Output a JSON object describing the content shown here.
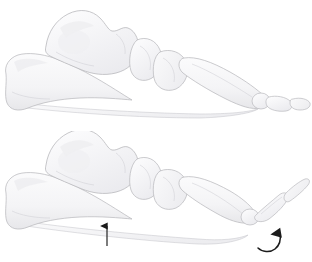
{
  "illustration": {
    "title": "Foot skeleton lateral view - windlass mechanism",
    "background_color": "#ffffff",
    "bone_fill_color": "#f7f7f8",
    "bone_outline_color": "#b9b9bd",
    "bone_shadow_color": "#e9e9ec",
    "arrow_color": "#1b1b1b",
    "panel_count": 2,
    "panels": [
      {
        "id": "panel-top",
        "label": "Neutral foot, resting position",
        "has_arrows": false,
        "toe_position": "neutral",
        "bones": [
          {
            "name": "calcaneus",
            "label": "Calcaneus"
          },
          {
            "name": "talus",
            "label": "Talus"
          },
          {
            "name": "navicular",
            "label": "Navicular"
          },
          {
            "name": "cuneiform",
            "label": "Cuneiform"
          },
          {
            "name": "metatarsal",
            "label": "Metatarsal"
          },
          {
            "name": "proximal-phalanx",
            "label": "Proximal phalanx"
          },
          {
            "name": "distal-phalanx",
            "label": "Distal phalanx"
          },
          {
            "name": "plantar-fascia",
            "label": "Plantar fascia"
          }
        ]
      },
      {
        "id": "panel-bottom",
        "label": "Foot with toe dorsiflexion, windlass engaged",
        "has_arrows": true,
        "toe_position": "dorsiflexed",
        "bones": [
          {
            "name": "calcaneus",
            "label": "Calcaneus"
          },
          {
            "name": "talus",
            "label": "Talus"
          },
          {
            "name": "navicular",
            "label": "Navicular"
          },
          {
            "name": "cuneiform",
            "label": "Cuneiform"
          },
          {
            "name": "metatarsal",
            "label": "Metatarsal"
          },
          {
            "name": "proximal-phalanx",
            "label": "Proximal phalanx"
          },
          {
            "name": "distal-phalanx",
            "label": "Distal phalanx"
          },
          {
            "name": "plantar-fascia",
            "label": "Plantar fascia"
          }
        ],
        "annotations": [
          {
            "name": "arch-elevation-arrow",
            "type": "straight-arrow",
            "direction": "up",
            "meaning": "Arch raises",
            "x": 107,
            "y_tail": 246,
            "y_head": 222
          },
          {
            "name": "toe-rotation-arrow",
            "type": "curved-arrow",
            "direction": "clockwise-upward",
            "meaning": "Toe dorsiflexion rotation",
            "x": 272,
            "y": 240
          }
        ]
      }
    ]
  }
}
